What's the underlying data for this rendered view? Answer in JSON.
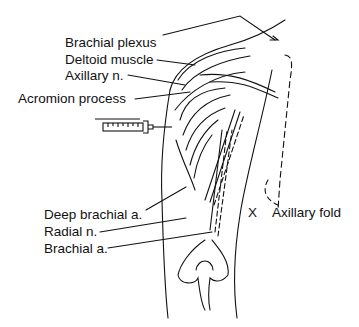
{
  "diagram": {
    "labels": {
      "brachial_plexus": "Brachial plexus",
      "deltoid_muscle": "Deltoid muscle",
      "axillary_n": "Axillary n.",
      "acromion_process": "Acromion process",
      "deep_brachial_a": "Deep brachial a.",
      "radial_n": "Radial n.",
      "brachial_a": "Brachial a.",
      "axillary_fold_marker": "X",
      "axillary_fold": "Axillary fold"
    },
    "icons": [
      "syringe-icon"
    ],
    "colors": {
      "ink": "#111111",
      "background": "#ffffff"
    }
  }
}
